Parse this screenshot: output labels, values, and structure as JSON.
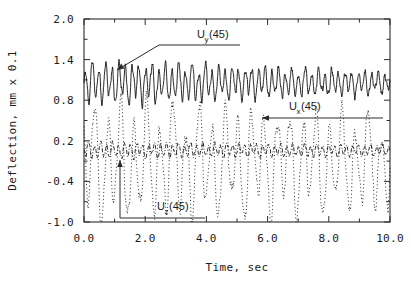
{
  "chart_data": {
    "type": "line",
    "title": "",
    "xlabel": "Time, sec",
    "ylabel": "Deflection, mm x 0.1",
    "xlim": [
      0.0,
      10.0
    ],
    "ylim": [
      -1.0,
      2.0
    ],
    "xticks": [
      0.0,
      2.0,
      4.0,
      6.0,
      8.0,
      10.0
    ],
    "xtick_labels": [
      "0.0",
      "2.0",
      "4.0",
      "6.0",
      "8.0",
      "10.0"
    ],
    "xminor_step": 1.0,
    "yticks": [
      -1.0,
      -0.4,
      0.2,
      0.8,
      1.4,
      2.0
    ],
    "ytick_labels": [
      "-1.0",
      "-0.4",
      "0.2",
      "0.8",
      "1.4",
      "2.0"
    ],
    "yminor_step": 0.3,
    "grid": false,
    "legend": "inline-annotations",
    "series": [
      {
        "name": "Uy (45)",
        "label_main": "U",
        "label_sub": "y",
        "label_suffix": " (45)",
        "style": "solid",
        "color": "#111111",
        "mean": 1.06,
        "amplitude": 0.2,
        "amplitude_start": 0.26,
        "amplitude_end": 0.13,
        "frequency": 4.6,
        "jitter": 0.055,
        "seed": 17
      },
      {
        "name": "Ux (45)",
        "label_main": "U",
        "label_sub": "x",
        "label_suffix": " (45)",
        "style": "dotted",
        "color": "#111111",
        "mean": -0.12,
        "amplitude": 0.62,
        "amplitude_start": 0.74,
        "amplitude_end": 0.58,
        "frequency": 2.35,
        "jitter": 0.1,
        "seed": 41
      },
      {
        "name": "Uz (45)",
        "label_main": "U",
        "label_sub": "z",
        "label_suffix": " (45)",
        "style": "dashdot",
        "color": "#111111",
        "mean": 0.06,
        "amplitude": 0.075,
        "amplitude_start": 0.1,
        "amplitude_end": 0.065,
        "frequency": 5.1,
        "jitter": 0.03,
        "seed": 93
      }
    ],
    "annotations": [
      {
        "id": "uy",
        "text_main": "U",
        "text_sub": "y",
        "text_suffix": " (45)",
        "label_x": 197,
        "label_y": 38,
        "leader": "M 240 45 L 159 45 L 117 70",
        "arrow_at": [
          117,
          70
        ],
        "arrow_dir": "down-left"
      },
      {
        "id": "ux",
        "text_main": "U",
        "text_sub": "x",
        "text_suffix": " (45)",
        "label_x": 289,
        "label_y": 110,
        "leader": "M 383 118 L 262 118",
        "arrow_at": [
          262,
          118
        ],
        "arrow_dir": "left"
      },
      {
        "id": "uz",
        "text_main": "U",
        "text_sub": "z",
        "text_suffix": " (45)",
        "label_x": 157,
        "label_y": 210,
        "leader": "M 205 218 L 120 218 L 120 160",
        "arrow_at": [
          120,
          160
        ],
        "arrow_dir": "up"
      }
    ]
  },
  "plot_box": {
    "left": 84,
    "right": 390,
    "top": 19,
    "bottom": 222
  }
}
